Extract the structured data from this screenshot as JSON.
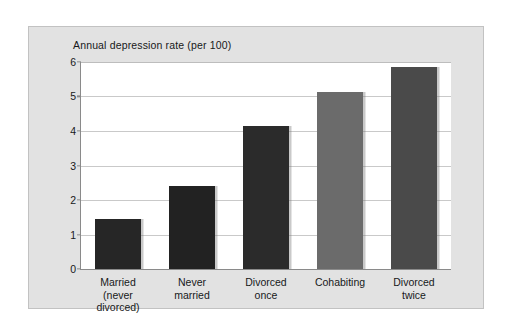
{
  "figure": {
    "title": "Annual depression rate (per 100)",
    "panel_bg_color": "#e2e2e2",
    "plot_bg_color": "#ffffff",
    "axis_color": "#8a8a8a",
    "gridline_color": "#c9c9c9"
  },
  "chart_data": {
    "type": "bar",
    "title": "Annual depression rate (per 100)",
    "xlabel": "",
    "ylabel": "Annual depression rate (per 100)",
    "ylim": [
      0,
      6
    ],
    "yticks": [
      0,
      1,
      2,
      3,
      4,
      5,
      6
    ],
    "ytick_labels": [
      "0",
      "1",
      "2",
      "3",
      "4",
      "5",
      "6"
    ],
    "grid": "horizontal",
    "legend": "none",
    "categories": [
      "Married\n(never divorced)",
      "Never\nmarried",
      "Divorced\nonce",
      "Cohabiting",
      "Divorced\ntwice"
    ],
    "values": [
      1.45,
      2.4,
      4.15,
      5.12,
      5.85
    ],
    "bar_colors": [
      "#262626",
      "#222222",
      "#2b2b2b",
      "#6b6b6b",
      "#4a4a4a"
    ]
  },
  "ghost_text": {
    "lines": [
      "",
      "",
      "",
      "",
      "",
      "",
      "",
      "",
      "",
      "",
      "",
      "",
      "",
      "",
      "",
      "",
      "",
      "",
      "",
      "",
      "",
      "",
      "",
      ""
    ]
  }
}
